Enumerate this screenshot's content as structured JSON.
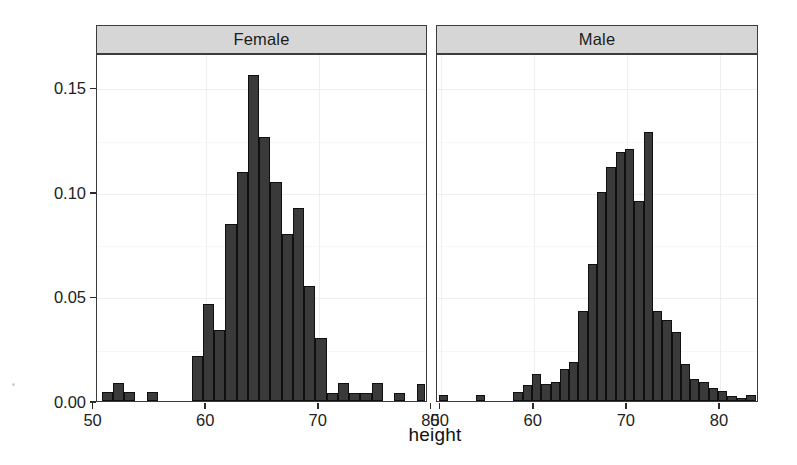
{
  "chart_data": {
    "type": "bar",
    "chart_kind": "faceted-histogram",
    "title": "",
    "xlabel": "height",
    "ylabel": "density",
    "ylim": [
      0.0,
      0.1665
    ],
    "grid": true,
    "legend": "none",
    "y_ticks": [
      {
        "value": 0.0,
        "label": "0.00"
      },
      {
        "value": 0.05,
        "label": "0.05"
      },
      {
        "value": 0.1,
        "label": "0.10"
      },
      {
        "value": 0.15,
        "label": "0.15"
      }
    ],
    "facets": [
      {
        "name": "Female",
        "label": "Female",
        "xlim": [
          50.3,
          79.7
        ],
        "x_ticks": [
          {
            "value": 50,
            "label": "50"
          },
          {
            "value": 60,
            "label": "60"
          },
          {
            "value": 70,
            "label": "70"
          },
          {
            "value": 80,
            "label": "80"
          }
        ],
        "bin_width": 1.0,
        "bins": [
          {
            "x0": 50.7,
            "x1": 51.7,
            "density": 0.0045
          },
          {
            "x0": 51.7,
            "x1": 52.7,
            "density": 0.0085
          },
          {
            "x0": 52.7,
            "x1": 53.7,
            "density": 0.0045
          },
          {
            "x0": 53.7,
            "x1": 54.7,
            "density": 0.0
          },
          {
            "x0": 54.7,
            "x1": 55.7,
            "density": 0.0045
          },
          {
            "x0": 55.7,
            "x1": 56.7,
            "density": 0.0
          },
          {
            "x0": 56.7,
            "x1": 57.7,
            "density": 0.0
          },
          {
            "x0": 57.7,
            "x1": 58.7,
            "density": 0.0
          },
          {
            "x0": 58.7,
            "x1": 59.7,
            "density": 0.0215
          },
          {
            "x0": 59.7,
            "x1": 60.7,
            "density": 0.0465
          },
          {
            "x0": 60.7,
            "x1": 61.7,
            "density": 0.034
          },
          {
            "x0": 61.7,
            "x1": 62.7,
            "density": 0.0845
          },
          {
            "x0": 62.7,
            "x1": 63.7,
            "density": 0.1095
          },
          {
            "x0": 63.7,
            "x1": 64.7,
            "density": 0.156
          },
          {
            "x0": 64.7,
            "x1": 65.7,
            "density": 0.1265
          },
          {
            "x0": 65.7,
            "x1": 66.7,
            "density": 0.105
          },
          {
            "x0": 66.7,
            "x1": 67.7,
            "density": 0.08
          },
          {
            "x0": 67.7,
            "x1": 68.7,
            "density": 0.0925
          },
          {
            "x0": 68.7,
            "x1": 69.7,
            "density": 0.055
          },
          {
            "x0": 69.7,
            "x1": 70.7,
            "density": 0.03
          },
          {
            "x0": 70.7,
            "x1": 71.7,
            "density": 0.004
          },
          {
            "x0": 71.7,
            "x1": 72.7,
            "density": 0.0085
          },
          {
            "x0": 72.7,
            "x1": 73.7,
            "density": 0.004
          },
          {
            "x0": 73.7,
            "x1": 74.7,
            "density": 0.004
          },
          {
            "x0": 74.7,
            "x1": 75.7,
            "density": 0.0085
          },
          {
            "x0": 75.7,
            "x1": 76.7,
            "density": 0.0
          },
          {
            "x0": 76.7,
            "x1": 77.7,
            "density": 0.004
          },
          {
            "x0": 77.7,
            "x1": 78.7,
            "density": 0.0
          },
          {
            "x0": 78.7,
            "x1": 79.4,
            "density": 0.008
          }
        ]
      },
      {
        "name": "Male",
        "label": "Male",
        "xlim": [
          49.6,
          84.2
        ],
        "x_ticks": [
          {
            "value": 50,
            "label": "50"
          },
          {
            "value": 60,
            "label": "60"
          },
          {
            "value": 70,
            "label": "70"
          },
          {
            "value": 80,
            "label": "80"
          }
        ],
        "bin_width": 1.0,
        "bins": [
          {
            "x0": 49.8,
            "x1": 50.8,
            "density": 0.003
          },
          {
            "x0": 50.8,
            "x1": 51.8,
            "density": 0.0
          },
          {
            "x0": 51.8,
            "x1": 52.8,
            "density": 0.0
          },
          {
            "x0": 52.8,
            "x1": 53.8,
            "density": 0.0
          },
          {
            "x0": 53.8,
            "x1": 54.8,
            "density": 0.003
          },
          {
            "x0": 54.8,
            "x1": 55.8,
            "density": 0.0
          },
          {
            "x0": 55.8,
            "x1": 56.8,
            "density": 0.0
          },
          {
            "x0": 56.8,
            "x1": 57.8,
            "density": 0.0
          },
          {
            "x0": 57.8,
            "x1": 58.8,
            "density": 0.0045
          },
          {
            "x0": 58.8,
            "x1": 59.8,
            "density": 0.0075
          },
          {
            "x0": 59.8,
            "x1": 60.8,
            "density": 0.013
          },
          {
            "x0": 60.8,
            "x1": 61.8,
            "density": 0.008
          },
          {
            "x0": 61.8,
            "x1": 62.8,
            "density": 0.009
          },
          {
            "x0": 62.8,
            "x1": 63.8,
            "density": 0.0155
          },
          {
            "x0": 63.8,
            "x1": 64.8,
            "density": 0.0185
          },
          {
            "x0": 64.8,
            "x1": 65.8,
            "density": 0.043
          },
          {
            "x0": 65.8,
            "x1": 66.8,
            "density": 0.0655
          },
          {
            "x0": 66.8,
            "x1": 67.8,
            "density": 0.1
          },
          {
            "x0": 67.8,
            "x1": 68.8,
            "density": 0.112
          },
          {
            "x0": 68.8,
            "x1": 69.8,
            "density": 0.119
          },
          {
            "x0": 69.8,
            "x1": 70.8,
            "density": 0.1205
          },
          {
            "x0": 70.8,
            "x1": 71.8,
            "density": 0.0955
          },
          {
            "x0": 71.8,
            "x1": 72.8,
            "density": 0.1285
          },
          {
            "x0": 72.8,
            "x1": 73.8,
            "density": 0.043
          },
          {
            "x0": 73.8,
            "x1": 74.8,
            "density": 0.039
          },
          {
            "x0": 74.8,
            "x1": 75.8,
            "density": 0.033
          },
          {
            "x0": 75.8,
            "x1": 76.8,
            "density": 0.0175
          },
          {
            "x0": 76.8,
            "x1": 77.8,
            "density": 0.0105
          },
          {
            "x0": 77.8,
            "x1": 78.8,
            "density": 0.009
          },
          {
            "x0": 78.8,
            "x1": 79.8,
            "density": 0.006
          },
          {
            "x0": 79.8,
            "x1": 80.8,
            "density": 0.005
          },
          {
            "x0": 80.8,
            "x1": 81.8,
            "density": 0.0025
          },
          {
            "x0": 81.8,
            "x1": 82.8,
            "density": 0.0015
          },
          {
            "x0": 82.8,
            "x1": 83.9,
            "density": 0.003
          }
        ]
      }
    ]
  },
  "style": {
    "bar_fill": "#3a3a3a",
    "bar_border": "#101010",
    "strip_fill": "#d6d6d6",
    "panel_border": "#3c3c3c",
    "grid_color": "#efefef",
    "background": "#ffffff"
  }
}
